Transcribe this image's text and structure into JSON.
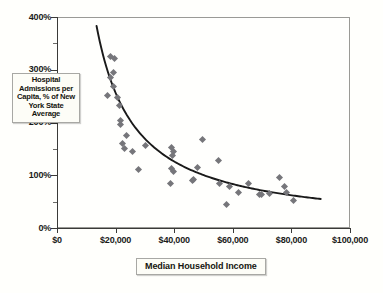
{
  "chart_data": {
    "type": "scatter",
    "title": "",
    "subtitle": "",
    "xlabel": "Median Household Income",
    "ylabel": "Hospital Admissions per Capita, % of New York State Average",
    "xlim": [
      0,
      100000
    ],
    "ylim": [
      0,
      400
    ],
    "grid": false,
    "legend": null,
    "x_tick_labels": [
      "$0",
      "$20,000",
      "$40,000",
      "$60,000",
      "$80,000",
      "$100,000"
    ],
    "x_tick_values": [
      0,
      20000,
      40000,
      60000,
      80000,
      100000
    ],
    "y_tick_labels": [
      "0%",
      "100%",
      "200%",
      "300%",
      "400%"
    ],
    "y_tick_values": [
      0,
      100,
      200,
      300,
      400
    ],
    "y_minor_tick_values": [
      50,
      150,
      250,
      350
    ],
    "marker_color": "#76767a",
    "marker_shape": "diamond",
    "trend_color": "#1a1a1a",
    "series": [
      {
        "name": "Counties",
        "points": [
          [
            18200,
            325
          ],
          [
            19700,
            322
          ],
          [
            19300,
            295
          ],
          [
            18300,
            285
          ],
          [
            19200,
            268
          ],
          [
            17200,
            252
          ],
          [
            20600,
            248
          ],
          [
            21300,
            232
          ],
          [
            21700,
            203
          ],
          [
            21800,
            197
          ],
          [
            23800,
            175
          ],
          [
            22300,
            160
          ],
          [
            23100,
            150
          ],
          [
            25900,
            145
          ],
          [
            30200,
            156
          ],
          [
            39200,
            152
          ],
          [
            39600,
            145
          ],
          [
            39300,
            138
          ],
          [
            49500,
            168
          ],
          [
            27900,
            110
          ],
          [
            55100,
            128
          ],
          [
            39000,
            112
          ],
          [
            39800,
            108
          ],
          [
            47800,
            114
          ],
          [
            38800,
            85
          ],
          [
            46200,
            90
          ],
          [
            46700,
            92
          ],
          [
            55300,
            84
          ],
          [
            58900,
            78
          ],
          [
            62100,
            68
          ],
          [
            65400,
            85
          ],
          [
            69200,
            63
          ],
          [
            69700,
            63
          ],
          [
            72400,
            65
          ],
          [
            75900,
            95
          ],
          [
            77700,
            78
          ],
          [
            78200,
            67
          ],
          [
            80600,
            52
          ],
          [
            57800,
            45
          ]
        ]
      }
    ],
    "trendline": {
      "type": "power-fit",
      "x_start": 13500,
      "x_end": 90000,
      "y_start": 383,
      "y_end": 55,
      "description": "Decreasing power-law curve fitted through scatter"
    }
  },
  "axis_titles": {
    "y": "Hospital Admissions per Capita, % of New York State Average",
    "x": "Median Household Income"
  }
}
